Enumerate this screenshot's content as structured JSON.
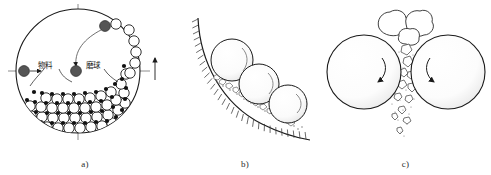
{
  "figure": {
    "background_color": "#ffffff",
    "line_color": "#1a1a1a",
    "ball_fill": "#ffffff",
    "material_fill": "#111111",
    "highlight_fill": "#555555"
  },
  "panels": [
    {
      "id": "a",
      "caption": "a)",
      "description": "Mill drum cross-section with grinding balls and material, cascading motion",
      "labels": [
        {
          "id": "material",
          "text": "物料",
          "meaning": "material"
        },
        {
          "id": "grinding-ball",
          "text": "磨球",
          "meaning": "grinding ball"
        }
      ],
      "icons": [
        "drum-circle-outline",
        "center-crosshair",
        "rotation-indicator-arrow",
        "ball-bed",
        "cascading-balls"
      ]
    },
    {
      "id": "b",
      "caption": "b)",
      "description": "Grinding balls rolling along hatched mill liner wall crushing particles",
      "labels": [],
      "icons": [
        "hatched-liner-wall",
        "grinding-sphere",
        "crushed-particles"
      ]
    },
    {
      "id": "c",
      "caption": "c)",
      "description": "Two grinding balls nipping and crushing feed into fine fragments and dust",
      "labels": [],
      "icons": [
        "grinding-sphere-left",
        "grinding-sphere-right",
        "feed-lumps",
        "falling-fragments",
        "dust-cloud",
        "rotation-arrow-left",
        "rotation-arrow-right"
      ]
    }
  ]
}
